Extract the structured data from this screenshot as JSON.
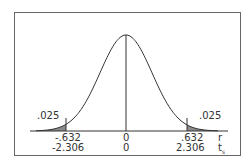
{
  "chart_data": {
    "type": "area",
    "title": "",
    "tail_areas": {
      "left": ".025",
      "right": ".025"
    },
    "axes": [
      {
        "name": "r",
        "ticks": [
          "-.632",
          "0",
          ".632"
        ]
      },
      {
        "name": "t",
        "subscript": "s",
        "ticks": [
          "-2.306",
          "0",
          "2.306"
        ]
      }
    ],
    "critical_values": {
      "r": [
        -0.632,
        0.632
      ],
      "t": [
        -2.306,
        2.306
      ]
    },
    "df": 8,
    "center_line": 0,
    "shaded_color": "#8a8a8a"
  },
  "labels": {
    "left_tail": ".025",
    "right_tail": ".025",
    "r_neg": "-.632",
    "r_zero": "0",
    "r_pos": ".632",
    "t_neg": "-2.306",
    "t_zero": "0",
    "t_pos": "2.306",
    "r_axis": "r",
    "t_axis": "t",
    "t_sub": "s"
  }
}
